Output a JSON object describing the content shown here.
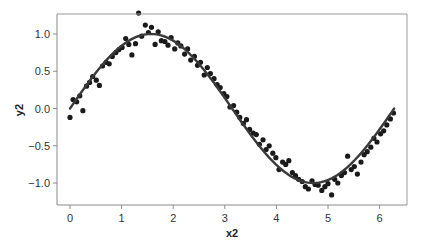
{
  "chart_data": {
    "type": "scatter",
    "title": "",
    "xlabel": "x2",
    "ylabel": "y2",
    "xlim": [
      -0.25,
      6.6
    ],
    "ylim": [
      -1.3,
      1.3
    ],
    "grid": false,
    "legend": null,
    "xticks": [
      0,
      1,
      2,
      3,
      4,
      5,
      6
    ],
    "xtick_labels": [
      "0",
      "1",
      "2",
      "3",
      "4",
      "5",
      "6"
    ],
    "yticks": [
      1.0,
      0.5,
      0.0,
      -0.5,
      -1.0
    ],
    "ytick_labels": [
      "1.0",
      "0.5",
      "0.0",
      "−0.5",
      "−1.0"
    ],
    "series": [
      {
        "name": "observations",
        "kind": "scatter",
        "color": "#1a1a1a",
        "x": [
          0.0,
          0.06,
          0.13,
          0.19,
          0.25,
          0.32,
          0.38,
          0.44,
          0.51,
          0.57,
          0.63,
          0.7,
          0.76,
          0.82,
          0.89,
          0.95,
          1.01,
          1.08,
          1.14,
          1.2,
          1.27,
          1.33,
          1.39,
          1.46,
          1.52,
          1.58,
          1.65,
          1.71,
          1.77,
          1.84,
          1.9,
          1.96,
          2.03,
          2.09,
          2.15,
          2.22,
          2.28,
          2.34,
          2.41,
          2.47,
          2.53,
          2.6,
          2.66,
          2.72,
          2.79,
          2.85,
          2.91,
          2.98,
          3.04,
          3.1,
          3.17,
          3.23,
          3.29,
          3.36,
          3.42,
          3.48,
          3.55,
          3.61,
          3.67,
          3.74,
          3.8,
          3.86,
          3.93,
          3.99,
          4.05,
          4.12,
          4.18,
          4.24,
          4.31,
          4.37,
          4.43,
          4.5,
          4.56,
          4.62,
          4.69,
          4.75,
          4.81,
          4.88,
          4.94,
          5.0,
          5.07,
          5.13,
          5.19,
          5.26,
          5.32,
          5.38,
          5.45,
          5.51,
          5.57,
          5.64,
          5.7,
          5.76,
          5.83,
          5.89,
          5.95,
          6.02,
          6.08,
          6.14,
          6.21,
          6.27
        ],
        "y": [
          -0.12,
          0.12,
          0.09,
          0.17,
          -0.03,
          0.3,
          0.35,
          0.43,
          0.38,
          0.31,
          0.57,
          0.62,
          0.6,
          0.7,
          0.75,
          0.79,
          0.82,
          0.94,
          0.86,
          0.72,
          0.87,
          1.28,
          0.97,
          1.12,
          1.02,
          1.09,
          0.86,
          1.03,
          0.91,
          0.9,
          0.85,
          0.95,
          0.8,
          0.88,
          0.84,
          0.73,
          0.8,
          0.65,
          0.7,
          0.58,
          0.62,
          0.45,
          0.55,
          0.47,
          0.4,
          0.32,
          0.28,
          0.2,
          0.16,
          0.02,
          0.04,
          -0.05,
          -0.12,
          -0.2,
          -0.15,
          -0.28,
          -0.33,
          -0.35,
          -0.48,
          -0.42,
          -0.55,
          -0.5,
          -0.6,
          -0.66,
          -0.82,
          -0.72,
          -0.75,
          -0.7,
          -0.86,
          -0.9,
          -0.95,
          -0.98,
          -1.05,
          -1.08,
          -0.97,
          -1.02,
          -1.03,
          -1.1,
          -1.05,
          -1.01,
          -1.16,
          -0.95,
          -1.0,
          -0.9,
          -0.86,
          -0.64,
          -0.82,
          -0.78,
          -0.88,
          -0.72,
          -0.62,
          -0.58,
          -0.52,
          -0.4,
          -0.45,
          -0.34,
          -0.3,
          -0.22,
          -0.14,
          -0.06
        ]
      },
      {
        "name": "fit",
        "kind": "line",
        "function": "sin(x)",
        "color": "#3a3a3a",
        "x_range": [
          0,
          6.2832
        ]
      }
    ]
  }
}
